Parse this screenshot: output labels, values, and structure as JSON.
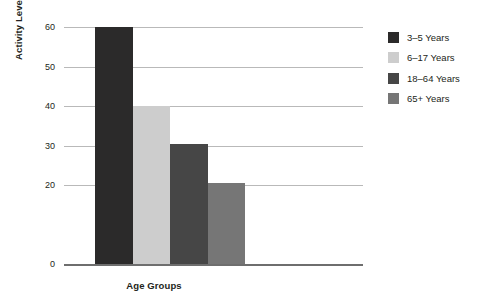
{
  "chart_data": {
    "type": "bar",
    "title": "",
    "xlabel": "Age Groups",
    "ylabel": "Activity Level per Minutes",
    "categories": [
      "3–5 Years",
      "6–17 Years",
      "18–64 Years",
      "65+ Years"
    ],
    "values": [
      60,
      40,
      30.5,
      20.5
    ],
    "ylim": [
      0,
      60
    ],
    "yticks": [
      0,
      20,
      30,
      40,
      50,
      60
    ],
    "ytick_labels": [
      "0",
      "20",
      "30",
      "40",
      "50",
      "60"
    ],
    "grid": true,
    "legend_position": "right",
    "colors": [
      "#2b2a2a",
      "#cdcdcd",
      "#464646",
      "#767676"
    ],
    "series": [
      {
        "name": "Activity Level per Minutes",
        "values": [
          60,
          40,
          30.5,
          20.5
        ]
      }
    ]
  },
  "axes": {
    "y_title": "Activity Level per Minutes",
    "x_title": "Age Groups",
    "ticks": [
      {
        "label": "60",
        "value": 60
      },
      {
        "label": "50",
        "value": 50
      },
      {
        "label": "40",
        "value": 40
      },
      {
        "label": "30",
        "value": 30
      },
      {
        "label": "20",
        "value": 20
      },
      {
        "label": "0",
        "value": 0
      }
    ]
  },
  "legend": {
    "items": [
      {
        "label": "3–5 Years",
        "color": "#2b2a2a"
      },
      {
        "label": "6–17 Years",
        "color": "#cdcdcd"
      },
      {
        "label": "18–64 Years",
        "color": "#464646"
      },
      {
        "label": "65+ Years",
        "color": "#767676"
      }
    ]
  },
  "style": {
    "background": "#ffffff",
    "gridline_color": "#b9b9b9",
    "axis_color": "#6e6e6e",
    "text_color": "#231f20"
  }
}
